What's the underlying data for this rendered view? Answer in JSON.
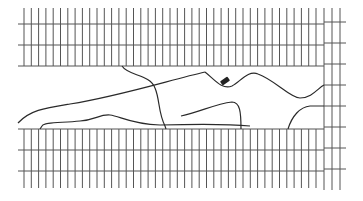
{
  "map": {
    "width": 363,
    "height": 201,
    "background": "#ffffff",
    "line_color": "#2a2a2a",
    "grid_color": "#555555",
    "top_block": {
      "x_start": 24,
      "x_end": 324,
      "y_top": 8,
      "y_bottom": 66,
      "h_lines": [
        24,
        45,
        66
      ],
      "v_spacing": 7.3
    },
    "bottom_block": {
      "x_start": 24,
      "x_end": 324,
      "y_top": 129,
      "y_bottom": 188,
      "h_lines": [
        129,
        150,
        171
      ],
      "v_spacing": 7.3
    },
    "right_strip": {
      "v_lines": [
        324,
        332,
        340
      ],
      "y_top": 8,
      "y_bottom": 190,
      "h_lines": [
        22,
        43,
        64,
        85,
        106,
        127,
        148,
        169
      ],
      "x_end": 346
    },
    "roads": [
      {
        "name": "diagonal-road",
        "d": "M18 123 C30 110,45 108,70 104 C120 96,170 80,205 72"
      },
      {
        "name": "winding-road",
        "d": "M205 72 C215 80,222 90,232 86 C240 82,248 70,258 74 C275 80,290 98,300 98 C312 98,318 88,324 85"
      },
      {
        "name": "crossing-road",
        "d": "M122 66 C128 76,150 74,155 88 C160 100,158 112,165 126 L166 129"
      },
      {
        "name": "lower-road",
        "d": "M40 129 L42 126 C44 122,60 123,80 121 C95 120,100 114,110 115 C120 116,130 124,160 125 C200 124,230 124,250 126"
      },
      {
        "name": "left-bulge",
        "d": "M181 116 C200 112,215 104,232 102 C240 102,241 112,241 129"
      },
      {
        "name": "right-bulge",
        "d": "M288 129 C292 116,300 107,310 106 L324 106"
      }
    ],
    "marker": {
      "name": "building-marker",
      "x": 225,
      "y": 81,
      "w": 9,
      "h": 5,
      "rotate": -35,
      "color": "#222222"
    }
  }
}
